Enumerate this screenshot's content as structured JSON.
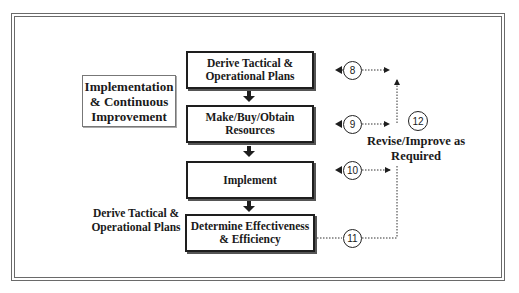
{
  "diagram": {
    "title_box": "Implementation & Continuous Improvement",
    "side_label": "Derive Tactical & Operational Plans",
    "steps": [
      {
        "label": "Derive Tactical & Operational Plans",
        "marker": "8"
      },
      {
        "label": "Make/Buy/Obtain Resources",
        "marker": "9"
      },
      {
        "label": "Implement",
        "marker": "10"
      },
      {
        "label": "Determine Effectiveness & Efficiency",
        "marker": "11"
      }
    ],
    "feedback": {
      "marker": "12",
      "label": "Revise/Improve as Required"
    },
    "colors": {
      "line": "#1e1e1e",
      "frame": "#6a6a6a",
      "background": "#ffffff"
    }
  }
}
